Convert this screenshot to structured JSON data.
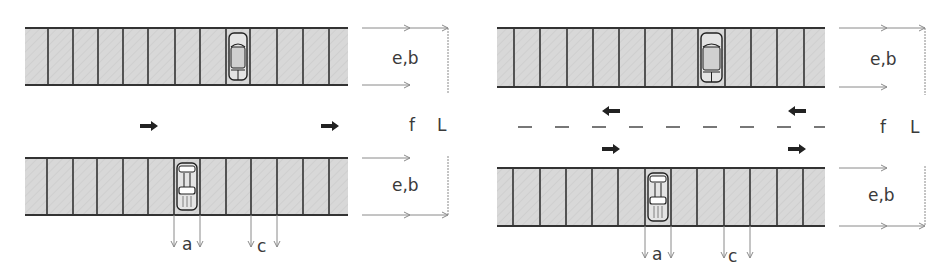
{
  "colors": {
    "stall_fill": "#d6d6d6",
    "stall_line": "#333333",
    "dimension_line": "#8a8a8a",
    "arrow": "#222222",
    "label": "#3a3a3a"
  },
  "diagrams": [
    {
      "name": "one-way-aisle",
      "offset_x": 0,
      "rows": [
        {
          "y": 28,
          "h": 57,
          "x0": 25,
          "x1": 348,
          "lines": [
            48,
            73,
            98,
            123,
            148,
            175,
            200,
            226,
            250,
            277,
            303,
            329
          ],
          "car": {
            "x": 226,
            "w": 24,
            "facing": "up"
          }
        },
        {
          "y": 158,
          "h": 57,
          "x0": 25,
          "x1": 348,
          "lines": [
            47,
            73,
            97,
            123,
            148,
            174,
            200,
            226,
            251,
            277,
            303,
            329
          ],
          "car": {
            "x": 174,
            "w": 26,
            "facing": "down"
          }
        }
      ],
      "traffic_arrows": [
        {
          "x": 140,
          "y": 126,
          "dir": "right"
        },
        {
          "x": 321,
          "y": 126,
          "dir": "right"
        }
      ],
      "center_dashes": null,
      "labels": {
        "row_top_dim": "e,b",
        "row_bottom_dim": "e,b",
        "aisle_width": "f",
        "total_length": "L",
        "stall_width_a": "a",
        "stall_width_c": "c"
      }
    },
    {
      "name": "two-way-aisle",
      "offset_x": 0,
      "rows": [
        {
          "y": 28,
          "h": 59,
          "x0": 497,
          "x1": 825,
          "lines": [
            514,
            540,
            567,
            593,
            619,
            645,
            672,
            698,
            725,
            751,
            777,
            804
          ],
          "car": {
            "x": 698,
            "w": 27,
            "facing": "up"
          }
        },
        {
          "y": 168,
          "h": 58,
          "x0": 497,
          "x1": 825,
          "lines": [
            513,
            540,
            566,
            592,
            618,
            645,
            671,
            697,
            724,
            750,
            777,
            803
          ],
          "car": {
            "x": 645,
            "w": 26,
            "facing": "down"
          }
        }
      ],
      "traffic_arrows": [
        {
          "x": 602,
          "y": 111,
          "dir": "left"
        },
        {
          "x": 788,
          "y": 111,
          "dir": "left"
        },
        {
          "x": 602,
          "y": 149,
          "dir": "right"
        },
        {
          "x": 788,
          "y": 149,
          "dir": "right"
        }
      ],
      "center_dashes": {
        "y": 127,
        "x0": 518,
        "x1": 825
      },
      "labels": {
        "row_top_dim": "e,b",
        "row_bottom_dim": "e,b",
        "aisle_width": "f",
        "total_length": "L",
        "stall_width_a": "a",
        "stall_width_c": "c"
      }
    }
  ]
}
